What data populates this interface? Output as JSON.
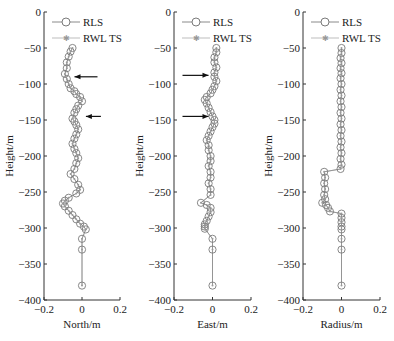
{
  "chart_data": [
    {
      "type": "line",
      "panel": "north",
      "xlabel": "North/m",
      "ylabel": "Height/m",
      "xlim": [
        -0.2,
        0.2
      ],
      "ylim": [
        -400,
        0
      ],
      "xticks": [
        "-0.2",
        "0",
        "0.2"
      ],
      "yticks": [
        "0",
        "-50",
        "-100",
        "-150",
        "-200",
        "-250",
        "-300",
        "-350",
        "-400"
      ],
      "legend": [
        "RLS",
        "RWL TS"
      ],
      "legend_position": "upper right",
      "grid": false,
      "annotations": [
        {
          "type": "arrow",
          "direction": "left",
          "height": -90
        },
        {
          "type": "arrow",
          "direction": "left",
          "height": -145
        }
      ],
      "series": [
        {
          "name": "RLS",
          "marker": "circle",
          "x": [
            -0.05,
            -0.06,
            -0.07,
            -0.08,
            -0.08,
            -0.09,
            -0.08,
            -0.07,
            -0.06,
            -0.04,
            -0.03,
            -0.01,
            0.0,
            -0.02,
            -0.03,
            -0.04,
            -0.05,
            -0.04,
            -0.03,
            -0.02,
            -0.03,
            -0.04,
            -0.05,
            -0.04,
            -0.03,
            -0.02,
            -0.03,
            -0.04,
            -0.06,
            -0.04,
            -0.02,
            -0.01,
            -0.03,
            -0.07,
            -0.09,
            -0.1,
            -0.09,
            -0.07,
            -0.05,
            -0.03,
            -0.01,
            0.01,
            0.02,
            0.0,
            0.0,
            0.0
          ],
          "y": [
            -50,
            -55,
            -62,
            -70,
            -78,
            -86,
            -93,
            -100,
            -106,
            -110,
            -114,
            -118,
            -124,
            -130,
            -135,
            -140,
            -148,
            -152,
            -157,
            -163,
            -170,
            -176,
            -183,
            -190,
            -196,
            -203,
            -210,
            -218,
            -225,
            -232,
            -240,
            -247,
            -252,
            -258,
            -262,
            -266,
            -270,
            -276,
            -282,
            -288,
            -294,
            -298,
            -302,
            -315,
            -330,
            -380
          ]
        },
        {
          "name": "RWL TS",
          "marker": "star",
          "x": [
            -0.05,
            -0.06,
            -0.07,
            -0.08,
            -0.08,
            -0.09,
            -0.08,
            -0.07,
            -0.06,
            -0.04,
            -0.03,
            -0.01,
            0.0,
            -0.02,
            -0.03,
            -0.04,
            -0.05,
            -0.04,
            -0.03,
            -0.02,
            -0.03,
            -0.04,
            -0.05,
            -0.04,
            -0.03,
            -0.02,
            -0.03,
            -0.04,
            -0.06,
            -0.04,
            -0.02,
            -0.01,
            -0.03,
            -0.07,
            -0.09,
            -0.1,
            -0.09,
            -0.07,
            -0.05,
            -0.03,
            -0.01,
            0.01,
            0.02,
            0.0,
            0.0,
            0.0
          ],
          "y": [
            -50,
            -55,
            -62,
            -70,
            -78,
            -86,
            -93,
            -100,
            -106,
            -110,
            -114,
            -118,
            -124,
            -130,
            -135,
            -140,
            -148,
            -152,
            -157,
            -163,
            -170,
            -176,
            -183,
            -190,
            -196,
            -203,
            -210,
            -218,
            -225,
            -232,
            -240,
            -247,
            -252,
            -258,
            -262,
            -266,
            -270,
            -276,
            -282,
            -288,
            -294,
            -298,
            -302,
            -315,
            -330,
            -380
          ]
        }
      ]
    },
    {
      "type": "line",
      "panel": "east",
      "xlabel": "East/m",
      "ylabel": "Height/m",
      "xlim": [
        -0.2,
        0.2
      ],
      "ylim": [
        -400,
        0
      ],
      "xticks": [
        "-0.2",
        "0",
        "0.2"
      ],
      "yticks": [
        "0",
        "-50",
        "-100",
        "-150",
        "-200",
        "-250",
        "-300",
        "-350",
        "-400"
      ],
      "legend": [
        "RLS",
        "RWL TS"
      ],
      "legend_position": "upper right",
      "grid": false,
      "annotations": [
        {
          "type": "arrow",
          "direction": "right",
          "height": -88
        },
        {
          "type": "arrow",
          "direction": "right",
          "height": -145
        }
      ],
      "series": [
        {
          "name": "RLS",
          "marker": "circle",
          "x": [
            0.02,
            0.02,
            0.01,
            0.01,
            0.02,
            0.01,
            0.01,
            0.02,
            0.01,
            0.0,
            -0.01,
            -0.03,
            -0.04,
            -0.03,
            -0.02,
            -0.01,
            0.0,
            0.01,
            0.01,
            0.0,
            -0.01,
            -0.02,
            -0.03,
            -0.02,
            -0.02,
            -0.01,
            -0.01,
            -0.02,
            -0.01,
            -0.01,
            -0.02,
            -0.01,
            -0.01,
            -0.06,
            -0.03,
            -0.01,
            -0.01,
            -0.02,
            -0.03,
            -0.04,
            -0.04,
            -0.04,
            0.0,
            0.0,
            0.0
          ],
          "y": [
            -50,
            -56,
            -63,
            -70,
            -77,
            -84,
            -90,
            -96,
            -103,
            -108,
            -113,
            -118,
            -122,
            -127,
            -133,
            -139,
            -145,
            -150,
            -155,
            -160,
            -166,
            -172,
            -178,
            -185,
            -192,
            -200,
            -207,
            -214,
            -222,
            -230,
            -238,
            -246,
            -254,
            -265,
            -268,
            -272,
            -278,
            -284,
            -290,
            -295,
            -298,
            -301,
            -315,
            -330,
            -380
          ]
        },
        {
          "name": "RWL TS",
          "marker": "star",
          "x": [
            0.02,
            0.02,
            0.01,
            0.01,
            0.02,
            0.01,
            0.01,
            0.02,
            0.01,
            0.0,
            -0.01,
            -0.03,
            -0.04,
            -0.03,
            -0.02,
            -0.01,
            0.0,
            0.01,
            0.01,
            0.0,
            -0.01,
            -0.02,
            -0.03,
            -0.02,
            -0.02,
            -0.01,
            -0.01,
            -0.02,
            -0.01,
            -0.01,
            -0.02,
            -0.01,
            -0.01,
            -0.06,
            -0.03,
            -0.01,
            -0.01,
            -0.02,
            -0.03,
            -0.04,
            -0.04,
            -0.04,
            0.0,
            0.0,
            0.0
          ],
          "y": [
            -50,
            -56,
            -63,
            -70,
            -77,
            -84,
            -90,
            -96,
            -103,
            -108,
            -113,
            -118,
            -122,
            -127,
            -133,
            -139,
            -145,
            -150,
            -155,
            -160,
            -166,
            -172,
            -178,
            -185,
            -192,
            -200,
            -207,
            -214,
            -222,
            -230,
            -238,
            -246,
            -254,
            -265,
            -268,
            -272,
            -278,
            -284,
            -290,
            -295,
            -298,
            -301,
            -315,
            -330,
            -380
          ]
        }
      ]
    },
    {
      "type": "line",
      "panel": "radius",
      "xlabel": "Radius/m",
      "ylabel": "Height/m",
      "xlim": [
        -0.2,
        0.2
      ],
      "ylim": [
        -400,
        0
      ],
      "xticks": [
        "-0.2",
        "0",
        "0.2"
      ],
      "yticks": [
        "0",
        "-50",
        "-100",
        "-150",
        "-200",
        "-250",
        "-300",
        "-350",
        "-400"
      ],
      "legend": [
        "RLS",
        "RWL TS"
      ],
      "legend_position": "upper right",
      "grid": false,
      "series": [
        {
          "name": "RLS",
          "marker": "circle",
          "x": [
            0.0,
            0.0,
            -0.005,
            0.0,
            -0.005,
            0.0,
            -0.005,
            0.0,
            -0.005,
            0.0,
            -0.005,
            0.0,
            -0.005,
            0.0,
            -0.005,
            0.0,
            -0.005,
            0.0,
            -0.005,
            0.0,
            -0.005,
            0.0,
            -0.005,
            -0.09,
            -0.085,
            -0.09,
            -0.085,
            -0.09,
            -0.085,
            -0.1,
            -0.08,
            -0.07,
            -0.06,
            0.0,
            0.0,
            0.0,
            0.0,
            0.0,
            0.0,
            0.0,
            0.0
          ],
          "y": [
            -50,
            -57,
            -64,
            -71,
            -78,
            -85,
            -92,
            -100,
            -108,
            -116,
            -124,
            -132,
            -140,
            -148,
            -156,
            -164,
            -172,
            -180,
            -188,
            -196,
            -204,
            -212,
            -218,
            -222,
            -230,
            -238,
            -246,
            -254,
            -260,
            -265,
            -268,
            -272,
            -277,
            -280,
            -286,
            -292,
            -298,
            -302,
            -315,
            -330,
            -380
          ]
        },
        {
          "name": "RWL TS",
          "marker": "star",
          "x": [
            0.0,
            0.0,
            -0.005,
            0.0,
            -0.005,
            0.0,
            -0.005,
            0.0,
            -0.005,
            0.0,
            -0.005,
            0.0,
            -0.005,
            0.0,
            -0.005,
            0.0,
            -0.005,
            0.0,
            -0.005,
            0.0,
            -0.005,
            0.0,
            -0.005,
            -0.09,
            -0.085,
            -0.09,
            -0.085,
            -0.09,
            -0.085,
            -0.1,
            -0.08,
            -0.07,
            -0.06,
            0.0,
            0.0,
            0.0,
            0.0,
            0.0,
            0.0,
            0.0,
            0.0
          ],
          "y": [
            -50,
            -57,
            -64,
            -71,
            -78,
            -85,
            -92,
            -100,
            -108,
            -116,
            -124,
            -132,
            -140,
            -148,
            -156,
            -164,
            -172,
            -180,
            -188,
            -196,
            -204,
            -212,
            -218,
            -222,
            -230,
            -238,
            -246,
            -254,
            -260,
            -265,
            -268,
            -272,
            -277,
            -280,
            -286,
            -292,
            -298,
            -302,
            -315,
            -330,
            -380
          ]
        }
      ]
    }
  ],
  "colors": {
    "axis": "#333333",
    "rls_marker": "#7a7a7a",
    "rwl_line": "#bdbdbd",
    "arrow": "#111111"
  }
}
